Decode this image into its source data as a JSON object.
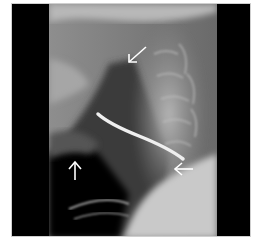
{
  "image": {
    "type": "lateral neck radiograph",
    "annotations": [
      {
        "id": "arrow-upper",
        "direction": "down-left",
        "color": "#ffffff"
      },
      {
        "id": "arrow-lower-left",
        "direction": "up",
        "color": "#ffffff"
      },
      {
        "id": "arrow-right",
        "direction": "left",
        "color": "#ffffff"
      }
    ],
    "features": [
      "radiopaque linear foreign body",
      "cervical spine",
      "airway"
    ]
  }
}
